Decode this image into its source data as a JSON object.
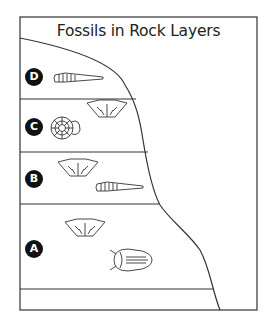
{
  "title": "Fossils in Rock Layers",
  "layers": [
    {
      "label": "D",
      "fossils": [
        "cone-shell"
      ]
    },
    {
      "label": "C",
      "fossils": [
        "ammonite",
        "brachiopod"
      ]
    },
    {
      "label": "B",
      "fossils": [
        "brachiopod",
        "cone-shell"
      ]
    },
    {
      "label": "A",
      "fossils": [
        "brachiopod",
        "trilobite"
      ]
    }
  ],
  "colors": {
    "line": "#333333",
    "badge": "#111111"
  }
}
